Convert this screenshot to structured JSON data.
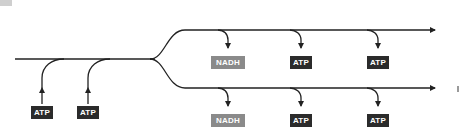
{
  "diagram": {
    "type": "pathway-flow",
    "colors": {
      "line": "#222222",
      "atp_box": "#2b2b2b",
      "nadh_box": "#8a8a8a",
      "text": "#ffffff"
    },
    "inputs": [
      {
        "label": "ATP"
      },
      {
        "label": "ATP"
      }
    ],
    "branches": [
      {
        "name": "upper",
        "outputs": [
          {
            "label": "NADH"
          },
          {
            "label": "ATP"
          },
          {
            "label": "ATP"
          }
        ]
      },
      {
        "name": "lower",
        "outputs": [
          {
            "label": "NADH"
          },
          {
            "label": "ATP"
          },
          {
            "label": "ATP"
          }
        ]
      }
    ]
  }
}
